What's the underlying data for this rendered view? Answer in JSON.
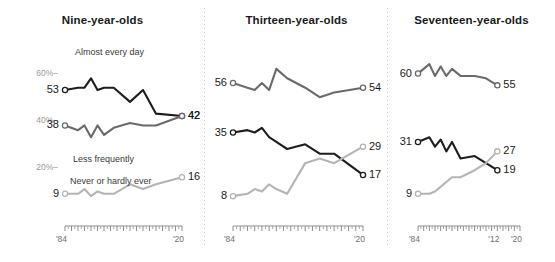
{
  "figure": {
    "background": "#ffffff",
    "colors": {
      "almost_every_day": "#1d1d1d",
      "less_frequently": "#6a6a6a",
      "never_or_hardly_ever": "#b4b4b4",
      "axis": "#8d8d8d",
      "axis_label": "#9a9a9a",
      "divider": "#c9c9c9"
    }
  },
  "y_axis": {
    "ticks": [
      {
        "label": "60%–",
        "value": 60
      },
      {
        "label": "40%–",
        "value": 40
      },
      {
        "label": "20%–",
        "value": 20
      }
    ],
    "range": [
      0,
      70
    ]
  },
  "x_axis": {
    "range": [
      1984,
      2020
    ],
    "major_ticks": [
      "'84",
      "'20"
    ],
    "tick_interval_years": 1
  },
  "series_labels": {
    "almost_every_day": "Almost every day",
    "less_frequently": "Less frequently",
    "never_or_hardly_ever": "Never or hardly ever"
  },
  "panels": [
    {
      "id": "nine-year-olds",
      "title": "Nine-year-olds",
      "x_tick_labels": [
        "'84",
        "'20"
      ],
      "x_tick_label_years": [
        1984,
        2020
      ],
      "x_end_year": 2020,
      "annotations": [
        {
          "name": "almost-every-day-label",
          "text": "Almost every day"
        },
        {
          "name": "less-frequently-label",
          "text": "Less frequently"
        },
        {
          "name": "never-or-hardly-ever-label",
          "text": "Never or hardly ever"
        }
      ],
      "series": [
        {
          "name": "almost_every_day",
          "label": "Almost every day",
          "color": "#1d1d1d",
          "start_label": "53",
          "end_label": "42",
          "x": [
            1984,
            1988,
            1990,
            1992,
            1994,
            1996,
            1999,
            2004,
            2008,
            2012,
            2020
          ],
          "values": [
            53,
            54,
            54,
            58,
            53,
            54,
            54,
            48,
            53,
            43,
            42
          ]
        },
        {
          "name": "less_frequently",
          "label": "Less frequently",
          "color": "#6a6a6a",
          "start_label": "38",
          "end_label": "42",
          "x": [
            1984,
            1988,
            1990,
            1992,
            1994,
            1996,
            1999,
            2004,
            2008,
            2012,
            2020
          ],
          "values": [
            38,
            36,
            38,
            33,
            38,
            34,
            37,
            39,
            38,
            38,
            42
          ]
        },
        {
          "name": "never_or_hardly_ever",
          "label": "Never or hardly ever",
          "color": "#b4b4b4",
          "start_label": "9",
          "end_label": "16",
          "x": [
            1984,
            1988,
            1990,
            1992,
            1994,
            1996,
            1999,
            2004,
            2008,
            2012,
            2020
          ],
          "values": [
            9,
            9,
            11,
            8,
            10,
            9,
            9,
            13,
            11,
            13,
            16
          ]
        }
      ]
    },
    {
      "id": "thirteen-year-olds",
      "title": "Thirteen-year-olds",
      "x_tick_labels": [
        "'84",
        "'20"
      ],
      "x_tick_label_years": [
        1984,
        2020
      ],
      "x_end_year": 2020,
      "annotations": [],
      "series": [
        {
          "name": "almost_every_day",
          "label": "Almost every day",
          "color": "#1d1d1d",
          "start_label": "35",
          "end_label": "17",
          "x": [
            1984,
            1988,
            1990,
            1992,
            1994,
            1996,
            1999,
            2004,
            2008,
            2012,
            2020
          ],
          "values": [
            35,
            36,
            35,
            37,
            33,
            31,
            28,
            30,
            26,
            26,
            17
          ]
        },
        {
          "name": "less_frequently",
          "label": "Less frequently",
          "color": "#6a6a6a",
          "start_label": "56",
          "end_label": "54",
          "x": [
            1984,
            1988,
            1990,
            1992,
            1994,
            1996,
            1999,
            2004,
            2008,
            2012,
            2020
          ],
          "values": [
            56,
            54,
            53,
            56,
            53,
            62,
            58,
            54,
            50,
            52,
            54
          ]
        },
        {
          "name": "never_or_hardly_ever",
          "label": "Never or hardly ever",
          "color": "#b4b4b4",
          "start_label": "8",
          "end_label": "29",
          "x": [
            1984,
            1988,
            1990,
            1992,
            1994,
            1996,
            1999,
            2004,
            2008,
            2012,
            2020
          ],
          "values": [
            8,
            9,
            11,
            10,
            13,
            11,
            9,
            22,
            24,
            22,
            29
          ]
        }
      ]
    },
    {
      "id": "seventeen-year-olds",
      "title": "Seventeen-year-olds",
      "x_tick_labels": [
        "'84",
        "'12",
        "'20"
      ],
      "x_tick_label_years": [
        1984,
        2012,
        2020
      ],
      "x_end_year": 2012,
      "annotations": [],
      "series": [
        {
          "name": "almost_every_day",
          "label": "Almost every day",
          "color": "#1d1d1d",
          "start_label": "31",
          "end_label": "19",
          "x": [
            1984,
            1988,
            1990,
            1992,
            1994,
            1996,
            1999,
            2004,
            2008,
            2012
          ],
          "values": [
            31,
            33,
            29,
            32,
            27,
            31,
            24,
            25,
            22,
            19
          ]
        },
        {
          "name": "less_frequently",
          "label": "Less frequently",
          "color": "#6a6a6a",
          "start_label": "60",
          "end_label": "55",
          "x": [
            1984,
            1988,
            1990,
            1992,
            1994,
            1996,
            1999,
            2004,
            2008,
            2012
          ],
          "values": [
            60,
            64,
            59,
            63,
            59,
            62,
            59,
            59,
            58,
            55
          ]
        },
        {
          "name": "never_or_hardly_ever",
          "label": "Never or hardly ever",
          "color": "#b4b4b4",
          "start_label": "9",
          "end_label": "27",
          "x": [
            1984,
            1988,
            1990,
            1992,
            1994,
            1996,
            1999,
            2004,
            2008,
            2012
          ],
          "values": [
            9,
            9,
            10,
            12,
            14,
            16,
            16,
            19,
            22,
            27
          ]
        }
      ]
    }
  ]
}
